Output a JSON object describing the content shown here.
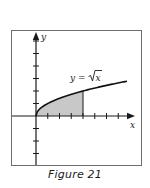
{
  "figure": {
    "caption": "Figure 21",
    "equation_label": "y = √x",
    "equation_prefix": "y = ",
    "equation_radicand": "x",
    "x_axis_label": "x",
    "y_axis_label": "y"
  },
  "colors": {
    "frame": "#6e6e6e",
    "axis": "#1a1a1a",
    "curve": "#111111",
    "shade": "#c8c8c8",
    "background": "#ffffff"
  },
  "chart_data": {
    "type": "line",
    "title": "",
    "caption": "Figure 21",
    "function": "y = sqrt(x)",
    "series": [
      {
        "name": "y = √x",
        "x": [
          0,
          0.25,
          1,
          2,
          3,
          4,
          5,
          6,
          7,
          7.75
        ],
        "y": [
          0,
          0.5,
          1,
          1.414,
          1.732,
          2,
          2.236,
          2.449,
          2.646,
          2.784
        ]
      }
    ],
    "shaded_region": {
      "description": "area under y = √x from x = 0 to x = 4",
      "x_from": 0,
      "x_to": 4
    },
    "xlabel": "x",
    "ylabel": "y",
    "xlim": [
      -2,
      8
    ],
    "ylim": [
      -4,
      6.5
    ],
    "x_ticks": [
      1,
      2,
      3,
      4,
      5,
      6,
      7
    ],
    "y_ticks": [
      -3,
      -2,
      -1,
      1,
      2,
      3,
      4,
      5,
      6
    ],
    "tick_labels_shown": false,
    "grid": false,
    "legend": "none"
  }
}
